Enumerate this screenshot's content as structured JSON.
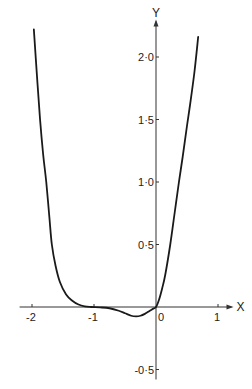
{
  "chart_data": {
    "type": "line",
    "title": "",
    "xlabel": "X",
    "ylabel": "Y",
    "xlim": [
      -2.2,
      1.25
    ],
    "ylim": [
      -0.58,
      2.3
    ],
    "grid": false,
    "legend": "none",
    "x_ticks": [
      {
        "value": -2,
        "label": "-2"
      },
      {
        "value": -1,
        "label": "-1"
      },
      {
        "value": 0,
        "label": "0"
      },
      {
        "value": 1,
        "label": "1"
      }
    ],
    "y_ticks": [
      {
        "value": 2.0,
        "label": "2·0"
      },
      {
        "value": 1.5,
        "label": "1·5"
      },
      {
        "value": 1.0,
        "label": "1·0"
      },
      {
        "value": 0.5,
        "label": "0·5"
      },
      {
        "value": -0.5,
        "label": "-0·5"
      }
    ],
    "series": [
      {
        "name": "curve",
        "x": [
          -1.97,
          -1.92,
          -1.87,
          -1.82,
          -1.77,
          -1.72,
          -1.68,
          -1.62,
          -1.55,
          -1.45,
          -1.35,
          -1.25,
          -1.15,
          -1.05,
          -0.9,
          -0.75,
          -0.6,
          -0.5,
          -0.4,
          -0.32,
          -0.25,
          -0.18,
          -0.1,
          -0.05,
          0,
          0.05,
          0.1,
          0.15,
          0.23,
          0.3,
          0.37,
          0.43,
          0.5,
          0.55,
          0.62,
          0.68
        ],
        "y": [
          2.22,
          1.85,
          1.5,
          1.22,
          1.0,
          0.72,
          0.5,
          0.33,
          0.2,
          0.1,
          0.05,
          0.02,
          0.005,
          0.0,
          -0.003,
          -0.01,
          -0.03,
          -0.05,
          -0.07,
          -0.075,
          -0.07,
          -0.055,
          -0.03,
          -0.015,
          0.0,
          0.06,
          0.15,
          0.26,
          0.5,
          0.75,
          1.0,
          1.2,
          1.45,
          1.62,
          1.88,
          2.16
        ]
      }
    ]
  }
}
